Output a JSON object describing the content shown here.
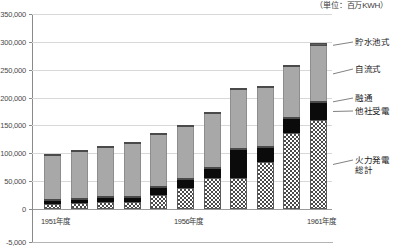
{
  "caption": {
    "unit": "（単位：百万KWH）"
  },
  "axis": {
    "y_ticks": [
      "350,000",
      "300,000",
      "250,000",
      "200,000",
      "150,000",
      "100,000",
      "50,000",
      "0",
      "-5,000"
    ],
    "y_values": [
      350000,
      300000,
      250000,
      200000,
      150000,
      100000,
      50000,
      0,
      -5000
    ],
    "x_labels": [
      {
        "text": "1951年度",
        "index": 0
      },
      {
        "text": "1956年度",
        "index": 5
      },
      {
        "text": "1961年度",
        "index": 10
      }
    ]
  },
  "legend": {
    "items": [
      {
        "key": "reservoir",
        "label": "貯水池式",
        "color": "#5e5e5e"
      },
      {
        "key": "runoff",
        "label": "自流式",
        "color": "#a8a8a8"
      },
      {
        "key": "interchange",
        "label": "融通",
        "color": "#ffffff"
      },
      {
        "key": "purchased",
        "label": "他社受電",
        "color": "#0b0b0b"
      },
      {
        "key": "thermal",
        "label": "火力発電",
        "label2": "総計",
        "color": "#4a4a4a"
      }
    ]
  },
  "chart_data": {
    "type": "bar",
    "stacked": true,
    "title": "",
    "subtitle": "",
    "xlabel": "",
    "ylabel": "",
    "unit": "百万KWH",
    "ylim": [
      -5000,
      350000
    ],
    "ytick_step": 50000,
    "grid": true,
    "legend_position": "right-callout",
    "categories": [
      "1951年度",
      "1952年度",
      "1953年度",
      "1954年度",
      "1955年度",
      "1956年度",
      "1957年度",
      "1958年度",
      "1959年度",
      "1960年度",
      "1961年度"
    ],
    "series": [
      {
        "name": "火力発電総計",
        "values": [
          9000,
          11000,
          13000,
          12000,
          25000,
          37000,
          55000,
          56000,
          85000,
          136000,
          159000
        ]
      },
      {
        "name": "他社受電",
        "values": [
          5000,
          6000,
          6000,
          8000,
          13000,
          15000,
          17000,
          50000,
          24000,
          25000,
          32000
        ]
      },
      {
        "name": "融通",
        "values": [
          2000,
          3000,
          3000,
          3000,
          3000,
          3000,
          2000,
          4000,
          3000,
          3000,
          2000
        ]
      },
      {
        "name": "自流式",
        "values": [
          77000,
          81000,
          87000,
          93000,
          91000,
          91000,
          95000,
          103000,
          104000,
          90000,
          98000
        ]
      },
      {
        "name": "貯水池式",
        "values": [
          4000,
          3000,
          4000,
          4000,
          3000,
          4000,
          3000,
          4000,
          5000,
          4000,
          5000
        ]
      }
    ],
    "totals": [
      97000,
      104000,
      113000,
      120000,
      135000,
      150000,
      172000,
      217000,
      221000,
      258000,
      296000
    ]
  }
}
